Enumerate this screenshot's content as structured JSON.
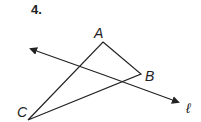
{
  "problem": {
    "number": "4.",
    "points": {
      "A": {
        "label": "A",
        "x": 103,
        "y": 42
      },
      "B": {
        "label": "B",
        "x": 141,
        "y": 74
      },
      "C": {
        "label": "C",
        "x": 28,
        "y": 120
      }
    },
    "line": {
      "label": "ℓ",
      "from": [
        31,
        49
      ],
      "to": [
        178,
        102
      ]
    },
    "stroke_color": "#222222"
  }
}
